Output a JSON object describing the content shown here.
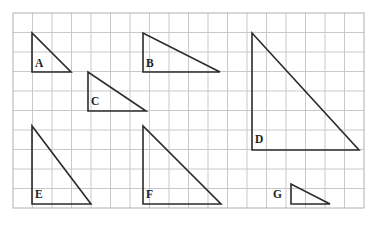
{
  "figure": {
    "background_color": "#ffffff",
    "grid": {
      "origin_x": 13,
      "origin_y": 13,
      "cell_size": 19.5,
      "columns": 18,
      "rows": 10,
      "line_color": "#c9c9c9",
      "border_color": "#b0b0b0",
      "line_width": 1
    },
    "stroke_color": "#2b2b2b",
    "stroke_width": 1.6,
    "label_color": "#1d1d1d",
    "shapes": [
      {
        "id": "triangle-a",
        "label": "A",
        "label_x": 35,
        "label_y": 67,
        "apex": [
          32,
          33
        ],
        "right_angle": [
          32,
          72
        ],
        "far": [
          71,
          72
        ],
        "legs_cells": {
          "height": 2,
          "base": 2
        }
      },
      {
        "id": "triangle-b",
        "label": "B",
        "label_x": 146,
        "label_y": 67,
        "apex": [
          143,
          33
        ],
        "right_angle": [
          143,
          72
        ],
        "far": [
          220,
          72
        ],
        "legs_cells": {
          "height": 2,
          "base": 4
        }
      },
      {
        "id": "triangle-c",
        "label": "C",
        "label_x": 91,
        "label_y": 105,
        "apex": [
          88,
          72
        ],
        "right_angle": [
          88,
          111
        ],
        "far": [
          146,
          111
        ],
        "legs_cells": {
          "height": 2,
          "base": 3
        }
      },
      {
        "id": "triangle-d",
        "label": "D",
        "label_x": 255,
        "label_y": 143,
        "apex": [
          252,
          33
        ],
        "right_angle": [
          252,
          150
        ],
        "far": [
          359,
          150
        ],
        "legs_cells": {
          "height": 6,
          "base": 5.5
        }
      },
      {
        "id": "triangle-e",
        "label": "E",
        "label_x": 35,
        "label_y": 198,
        "apex": [
          32,
          126
        ],
        "right_angle": [
          32,
          204
        ],
        "far": [
          91,
          204
        ],
        "legs_cells": {
          "height": 4,
          "base": 3
        }
      },
      {
        "id": "triangle-f",
        "label": "F",
        "label_x": 146,
        "label_y": 198,
        "apex": [
          143,
          126
        ],
        "right_angle": [
          143,
          204
        ],
        "far": [
          221,
          204
        ],
        "legs_cells": {
          "height": 4,
          "base": 4
        }
      },
      {
        "id": "triangle-g",
        "label": "G",
        "label_x": 273,
        "label_y": 198,
        "apex": [
          291,
          184
        ],
        "right_angle": [
          291,
          204
        ],
        "far": [
          330,
          204
        ],
        "legs_cells": {
          "height": 1,
          "base": 2
        }
      }
    ]
  }
}
